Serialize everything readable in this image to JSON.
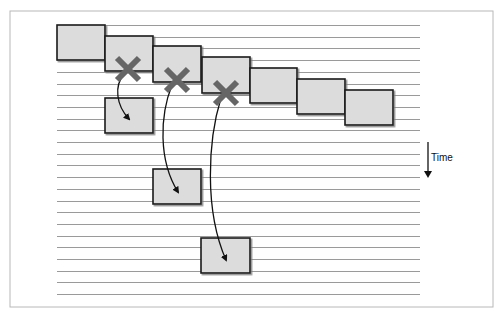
{
  "figure": {
    "frame": {
      "x": 10,
      "y": 11,
      "w": 483,
      "h": 296,
      "stroke": "#b8b8b8"
    },
    "timeline": {
      "line_count": 24,
      "first_y": 25,
      "spacing": 11.7,
      "x_start": 57,
      "x_end": 420,
      "stroke": "#9a9a9a"
    },
    "box_style": {
      "fill": "#dcdcdc",
      "stroke": "#1a1a1a",
      "shadow": "#888888"
    },
    "top_boxes": [
      {
        "x": 57,
        "y": 25,
        "w": 48,
        "h": 35
      },
      {
        "x": 105,
        "y": 36,
        "w": 48,
        "h": 35
      },
      {
        "x": 153,
        "y": 46,
        "w": 48,
        "h": 36
      },
      {
        "x": 202,
        "y": 57,
        "w": 48,
        "h": 36
      },
      {
        "x": 250,
        "y": 68,
        "w": 47,
        "h": 35
      },
      {
        "x": 297,
        "y": 79,
        "w": 48,
        "h": 35
      },
      {
        "x": 345,
        "y": 90,
        "w": 48,
        "h": 35
      }
    ],
    "failures": [
      {
        "cx": 128,
        "cy": 69,
        "size": 22,
        "color": "#666666"
      },
      {
        "cx": 177,
        "cy": 80,
        "size": 22,
        "color": "#666666"
      },
      {
        "cx": 226,
        "cy": 93,
        "size": 22,
        "color": "#666666"
      }
    ],
    "retry_boxes": [
      {
        "x": 105,
        "y": 98,
        "w": 48,
        "h": 35
      },
      {
        "x": 153,
        "y": 169,
        "w": 48,
        "h": 35
      },
      {
        "x": 201,
        "y": 238,
        "w": 49,
        "h": 35
      }
    ],
    "arrows": [
      {
        "d": "M 124 74 C 114 86, 116 105, 129 119"
      },
      {
        "d": "M 172 85 C 160 115, 158 160, 178 192"
      },
      {
        "d": "M 221 98 C 208 140, 204 210, 226 260"
      }
    ],
    "time_indicator": {
      "label": "Time",
      "x": 428,
      "y1": 142,
      "y2": 178
    }
  }
}
